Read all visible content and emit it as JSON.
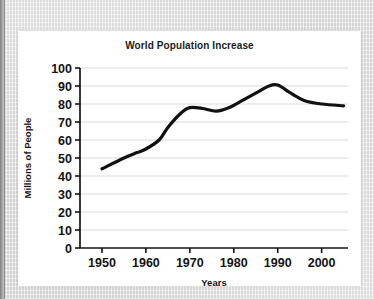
{
  "figure": {
    "title": "World Population Increase"
  },
  "chart_data": {
    "type": "line",
    "title": "World Population Increase",
    "xlabel": "Years",
    "ylabel": "Millions of People",
    "xlim": [
      1945,
      2006
    ],
    "ylim": [
      0,
      100
    ],
    "xticks": [
      1950,
      1960,
      1970,
      1980,
      1990,
      2000
    ],
    "xtick_labels": [
      "1950",
      "1960",
      "1970",
      "1980",
      "1990",
      "2000"
    ],
    "yticks": [
      0,
      10,
      20,
      30,
      40,
      50,
      60,
      70,
      80,
      90,
      100
    ],
    "ytick_labels": [
      "0",
      "10",
      "20",
      "30",
      "40",
      "50",
      "60",
      "70",
      "80",
      "90",
      "100"
    ],
    "grid": true,
    "grid_axis": "y",
    "legend": "none",
    "series": [
      {
        "name": "World population increase",
        "color": "#111111",
        "line_width": 3.2,
        "x": [
          1950,
          1955,
          1958,
          1960,
          1963,
          1965,
          1968,
          1970,
          1973,
          1976,
          1979,
          1982,
          1985,
          1988,
          1990,
          1993,
          1996,
          2000,
          2005
        ],
        "y": [
          44,
          50,
          53,
          55,
          60,
          67,
          75,
          78,
          77.5,
          76,
          78,
          82,
          86,
          90,
          90.5,
          86,
          82,
          80,
          79
        ]
      }
    ]
  }
}
